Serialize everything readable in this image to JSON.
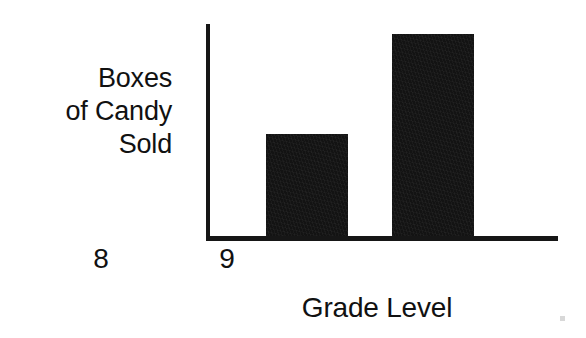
{
  "chart_data": {
    "type": "bar",
    "title": "",
    "subtitle": "",
    "xlabel": "Grade Level",
    "ylabel": "Boxes of Candy Sold",
    "ylabel_lines": [
      "Boxes",
      "of Candy",
      "Sold"
    ],
    "categories": [
      "8",
      "9"
    ],
    "values": [
      10,
      20
    ],
    "bar_pixel_heights": [
      102,
      202
    ],
    "ylim": [
      0,
      21.5
    ],
    "yticks": [],
    "ytick_labels": [],
    "grid": false,
    "legend": false,
    "legend_position": "none",
    "annotations": [],
    "series": [
      {
        "name": "Boxes of Candy Sold",
        "values": [
          10,
          20
        ],
        "color": "#131313"
      }
    ],
    "axis_color": "#161616",
    "background_color": "#ffffff",
    "note": "Unlabeled value axis; bar 9 is exactly twice the height of bar 8."
  },
  "figure": {
    "background_color": "#ffffff",
    "text_color": "#111111",
    "bar_color": "#131313",
    "axis_color": "#161616"
  },
  "artifacts": {
    "speck_label": "scan-speck",
    "speck_color": "#d8d8d8"
  }
}
